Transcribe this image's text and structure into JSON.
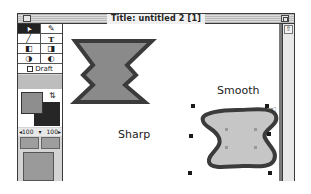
{
  "window": {
    "title": "Title: untitled 2 [1]"
  },
  "toolbox": {
    "tools": [
      [
        {
          "name": "arrow",
          "glyph": "➤"
        },
        {
          "name": "eyedropper",
          "glyph": "✎"
        }
      ],
      [
        {
          "name": "line",
          "glyph": "╱"
        },
        {
          "name": "text",
          "glyph": "T"
        }
      ],
      [
        {
          "name": "rectangle",
          "glyph": "◧"
        },
        {
          "name": "rounded-rect",
          "glyph": "◨"
        }
      ],
      [
        {
          "name": "oval",
          "glyph": "◑"
        },
        {
          "name": "freehand",
          "glyph": "◐"
        }
      ]
    ],
    "draft_label": "Draft",
    "swap_glyph": "⇅",
    "zoom_left": "◂100",
    "zoom_mid": "▾",
    "zoom_right": "100▸"
  },
  "canvas": {
    "sharp_label": "Sharp",
    "smooth_label": "Smooth"
  },
  "scrollbar": {
    "up_glyph": "⇧"
  },
  "colors": {
    "fill": "#8e8e8e",
    "stroke": "#262626",
    "sharp_fill": "#8a8a8a",
    "smooth_fill": "#c6c6c6"
  }
}
